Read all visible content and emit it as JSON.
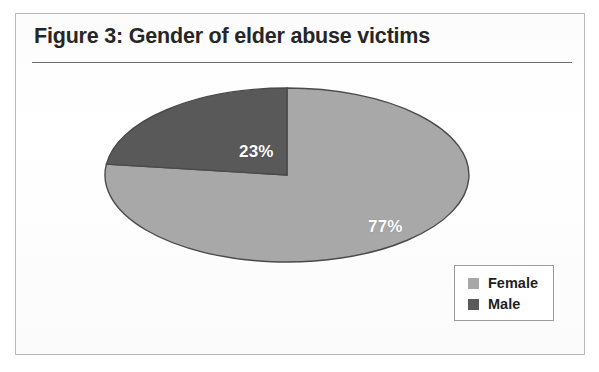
{
  "figure": {
    "title": "Figure 3: Gender of elder abuse victims"
  },
  "legend": {
    "items": [
      {
        "label": "Female",
        "color": "#a8a8a8",
        "swatch_name": "legend-swatch-female"
      },
      {
        "label": "Male",
        "color": "#595959",
        "swatch_name": "legend-swatch-male"
      }
    ]
  },
  "labels": {
    "female": "77%",
    "male": "23%"
  },
  "colors": {
    "female_slice": "#a8a8a8",
    "male_slice": "#595959",
    "slice_outline": "#4a4a4a",
    "title_text": "#262626",
    "frame_border": "#b8b8b8",
    "rule": "#6f6f6f",
    "label_text": "#ffffff"
  },
  "chart_data": {
    "type": "pie",
    "title": "Figure 3: Gender of elder abuse victims",
    "categories": [
      "Female",
      "Male"
    ],
    "values": [
      77,
      23
    ],
    "value_labels": [
      "77%",
      "23%"
    ],
    "units": "percent",
    "total": 100,
    "colors": [
      "#a8a8a8",
      "#595959"
    ],
    "legend_position": "bottom-right",
    "grid": false,
    "xlabel": "",
    "ylabel": "",
    "start_angle_deg": 270,
    "direction": "counterclockwise",
    "shape": "ellipse",
    "ellipse_rx": 182,
    "ellipse_ry": 87
  }
}
